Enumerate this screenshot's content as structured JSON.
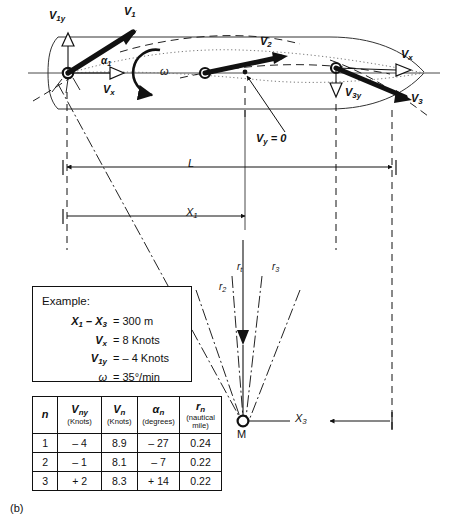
{
  "figure": {
    "caption": "(b)",
    "vectors": {
      "v1y": "V1y",
      "v1": "V1",
      "v2": "V2",
      "v3": "V3",
      "v3y": "V3y",
      "vx_left": "Vx",
      "vx_right": "Vx",
      "alpha1": "α1",
      "omega": "ω",
      "vy_zero": "Vy = 0"
    },
    "dimensions": {
      "l": "L",
      "x1": "X1",
      "x3": "X3"
    },
    "radii": {
      "r1": "r1",
      "r2": "r2",
      "r3": "r3",
      "rt": "rt"
    },
    "center_point": "M"
  },
  "example": {
    "title": "Example:",
    "rows": [
      {
        "lhs": "X1 – X3",
        "rhs": "= 300 m"
      },
      {
        "lhs": "Vx",
        "rhs": "= 8 Knots"
      },
      {
        "lhs": "V1y",
        "rhs": "= – 4 Knots"
      },
      {
        "lhs": "ω",
        "rhs": "= 35°/min"
      }
    ]
  },
  "table": {
    "headers": [
      {
        "symbol": "n",
        "unit": ""
      },
      {
        "symbol": "Vny",
        "unit": "(Knots)"
      },
      {
        "symbol": "Vn",
        "unit": "(Knots)"
      },
      {
        "symbol": "αn",
        "unit": "(degrees)"
      },
      {
        "symbol": "rn",
        "unit": "(nautical mile)"
      }
    ],
    "rows": [
      [
        "1",
        "– 4",
        "8.9",
        "– 27",
        "0.24"
      ],
      [
        "2",
        "– 1",
        "8.1",
        "–  7",
        "0.22"
      ],
      [
        "3",
        "+ 2",
        "8.3",
        "+ 14",
        "0.22"
      ]
    ]
  },
  "colors": {
    "ink": "#111111",
    "hull": "#333333",
    "dotted": "#666666"
  }
}
